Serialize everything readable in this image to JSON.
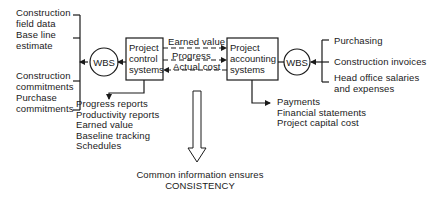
{
  "left_inputs": {
    "group_top": [
      "Construction",
      "field data",
      "Base line",
      "estimate"
    ],
    "group_bottom": [
      "Construction",
      "commitments",
      "Purchase",
      "commitments"
    ]
  },
  "left_wbs": {
    "label": "WBS"
  },
  "control_box": {
    "lines": [
      "Project",
      "control",
      "systems"
    ]
  },
  "flows": {
    "earned_value": "Earned value",
    "progress": "Progress",
    "actual_cost": "Actual cost"
  },
  "accounting_box": {
    "lines": [
      "Project",
      "accounting",
      "systems"
    ]
  },
  "right_wbs": {
    "label": "WBS"
  },
  "right_inputs": {
    "purchasing": "Purchasing",
    "construction_invoices": "Construction invoices",
    "head_office": [
      "Head office salaries",
      "and expenses"
    ]
  },
  "control_outputs": [
    "Progress reports",
    "Productivity reports",
    "Earned value",
    "Baseline tracking",
    "Schedules"
  ],
  "accounting_outputs": [
    "Payments",
    "Financial statements",
    "Project capital cost"
  ],
  "conclusion": {
    "line1": "Common information ensures",
    "line2": "CONSISTENCY"
  },
  "colors": {
    "ink": "#1a1a1a",
    "background": "#ffffff"
  }
}
